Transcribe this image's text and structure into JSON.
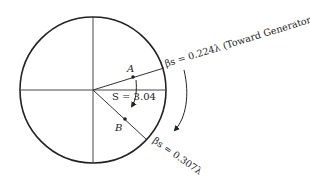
{
  "diagram": {
    "type": "smith-chart-rotation",
    "circle": {
      "cx": 93,
      "cy": 90,
      "r": 73
    },
    "colors": {
      "stroke": "#222222",
      "background": "#ffffff"
    },
    "points": {
      "A": {
        "label": "A"
      },
      "B": {
        "label": "B"
      }
    },
    "labels": {
      "swr": "S = 3.04",
      "beta_a": "βs = 0.224λ (Toward Generator)",
      "beta_b": "βs = 0.307λ"
    }
  }
}
